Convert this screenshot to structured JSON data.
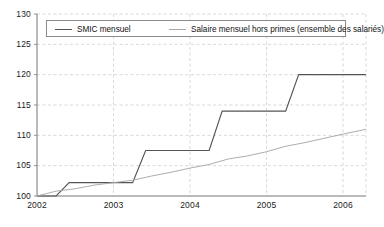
{
  "chart_data": {
    "type": "line",
    "title": "",
    "xlabel": "",
    "ylabel": "",
    "xlim": [
      2002.0,
      2006.3
    ],
    "ylim": [
      100,
      130
    ],
    "grid": true,
    "grid_style": "dashed",
    "legend_position": "top-inside",
    "y_ticks": [
      100,
      105,
      110,
      115,
      120,
      125,
      130
    ],
    "y_tick_labels": [
      "100",
      "105",
      "110",
      "115",
      "120",
      "125",
      "130"
    ],
    "x_ticks": [
      2002,
      2003,
      2004,
      2005,
      2006
    ],
    "x_tick_labels": [
      "2002",
      "2003",
      "2004",
      "2005",
      "2006"
    ],
    "series": [
      {
        "name": "SMIC mensuel",
        "color": "#555555",
        "style": "step",
        "x": [
          2002.0,
          2002.25,
          2002.42,
          2002.5,
          2003.25,
          2003.42,
          2003.5,
          2004.25,
          2004.42,
          2004.5,
          2005.25,
          2005.42,
          2005.5,
          2006.3
        ],
        "values": [
          100.0,
          100.0,
          102.2,
          102.2,
          102.2,
          107.5,
          107.5,
          107.5,
          114.0,
          114.0,
          114.0,
          120.0,
          120.0,
          120.0
        ]
      },
      {
        "name": "Salaire mensuel hors primes (ensemble des salariés)",
        "color": "#a8a8a8",
        "style": "line",
        "x": [
          2002.0,
          2002.25,
          2002.5,
          2002.75,
          2003.0,
          2003.25,
          2003.5,
          2003.75,
          2004.0,
          2004.25,
          2004.5,
          2004.75,
          2005.0,
          2005.25,
          2005.5,
          2005.75,
          2006.0,
          2006.3
        ],
        "values": [
          100.0,
          100.8,
          101.2,
          101.8,
          102.2,
          102.6,
          103.3,
          103.9,
          104.6,
          105.2,
          106.1,
          106.6,
          107.3,
          108.2,
          108.8,
          109.5,
          110.2,
          111.0
        ]
      }
    ]
  },
  "legend": {
    "entries": [
      {
        "label": "SMIC mensuel",
        "color": "#555555"
      },
      {
        "label": "Salaire mensuel hors primes (ensemble des salariés)",
        "color": "#a8a8a8"
      }
    ]
  },
  "source_note": ""
}
